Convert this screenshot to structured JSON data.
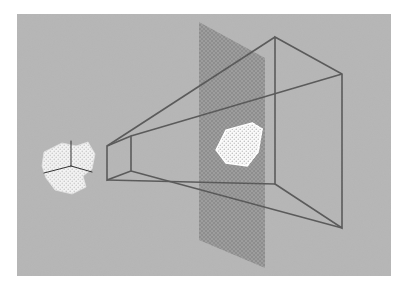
{
  "figure": {
    "caption_artifact": "                                                          ",
    "panel": {
      "background_color": "#b6b6b6",
      "x": 17,
      "y": 14,
      "width": 374,
      "height": 262
    },
    "elements": [
      {
        "name": "view-frustum-wireframe",
        "label": "view frustum",
        "stroke_color": "#595959"
      },
      {
        "name": "image-plane",
        "label": "image plane",
        "fill_color": "#9a9a9a"
      },
      {
        "name": "world-object",
        "label": "object in world",
        "fill_color": "#f2f2f2"
      },
      {
        "name": "projected-object",
        "label": "projected object",
        "fill_color": "#fbfbfb"
      },
      {
        "name": "coordinate-axes",
        "label": "object coordinate axes",
        "stroke_color": "#3a3a3a"
      }
    ]
  },
  "geometry": {
    "frustum": {
      "near_face": [
        [
          107,
          146
        ],
        [
          131,
          136
        ],
        [
          131,
          171
        ],
        [
          107,
          180
        ]
      ],
      "far_face": [
        [
          275,
          37
        ],
        [
          342,
          74
        ],
        [
          342,
          228
        ],
        [
          275,
          184
        ]
      ],
      "edges": [
        [
          [
            107,
            146
          ],
          [
            275,
            37
          ]
        ],
        [
          [
            131,
            136
          ],
          [
            342,
            74
          ]
        ],
        [
          [
            107,
            180
          ],
          [
            275,
            184
          ]
        ],
        [
          [
            131,
            171
          ],
          [
            342,
            228
          ]
        ]
      ]
    },
    "image_plane": {
      "points": [
        [
          199,
          22
        ],
        [
          265,
          58
        ],
        [
          265,
          268
        ],
        [
          199,
          240
        ]
      ]
    },
    "world_object": {
      "points": [
        [
          44,
          152
        ],
        [
          62,
          143
        ],
        [
          76,
          146
        ],
        [
          88,
          142
        ],
        [
          95,
          154
        ],
        [
          92,
          169
        ],
        [
          83,
          176
        ],
        [
          86,
          187
        ],
        [
          72,
          194
        ],
        [
          55,
          190
        ],
        [
          46,
          178
        ],
        [
          42,
          166
        ]
      ]
    },
    "projected_object": {
      "points": [
        [
          216,
          150
        ],
        [
          226,
          130
        ],
        [
          252,
          123
        ],
        [
          262,
          129
        ],
        [
          258,
          152
        ],
        [
          247,
          166
        ],
        [
          226,
          163
        ]
      ]
    },
    "axes": [
      {
        "from": [
          71,
          166
        ],
        "to": [
          71,
          141
        ]
      },
      {
        "from": [
          71,
          166
        ],
        "to": [
          44,
          173
        ]
      },
      {
        "from": [
          71,
          166
        ],
        "to": [
          92,
          172
        ]
      }
    ]
  },
  "colors": {
    "page_background": "#ffffff",
    "panel_gray": "#b6b6b6",
    "plane_gray": "#9a9a9a",
    "line_dark": "#595959",
    "object_light": "#f2f2f2",
    "axis_dark": "#303030"
  }
}
